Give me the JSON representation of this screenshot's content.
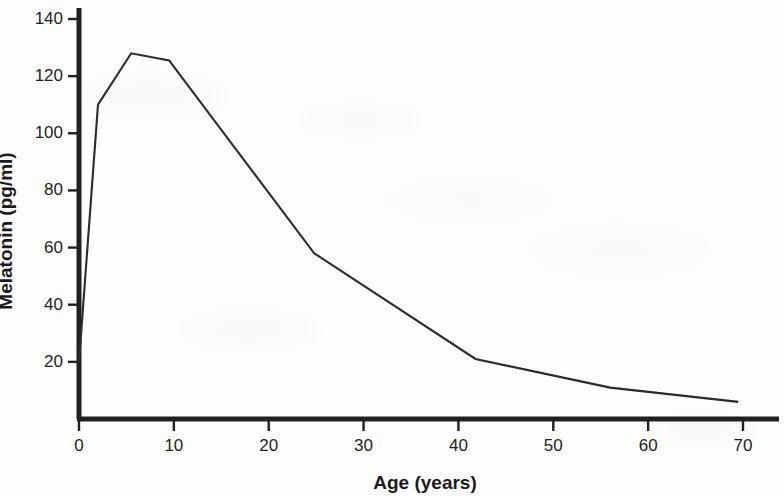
{
  "chart_data": {
    "type": "line",
    "title": "",
    "xlabel": "Age (years)",
    "ylabel": "Melatonin (pg/ml)",
    "xlim": [
      0,
      70
    ],
    "ylim": [
      0,
      148
    ],
    "xticks": [
      0,
      10,
      20,
      30,
      40,
      50,
      60,
      70
    ],
    "xtick_labels": [
      "0",
      "10",
      "20",
      "30",
      "40",
      "50",
      "60",
      "70"
    ],
    "yticks": [
      20,
      40,
      60,
      80,
      100,
      120,
      140
    ],
    "ytick_labels": [
      "20",
      "40",
      "60",
      "80",
      "100",
      "120",
      "140"
    ],
    "grid": false,
    "legend": null,
    "series": [
      {
        "name": "Melatonin",
        "x": [
          0,
          2,
          5.5,
          9.5,
          24.8,
          41.8,
          56,
          69.5
        ],
        "y": [
          20,
          110,
          128,
          125.5,
          58,
          21,
          11,
          6
        ]
      }
    ],
    "line_color": "#2b2b2b",
    "axis_color": "#231f20",
    "background_color": "#fdfdfb"
  }
}
